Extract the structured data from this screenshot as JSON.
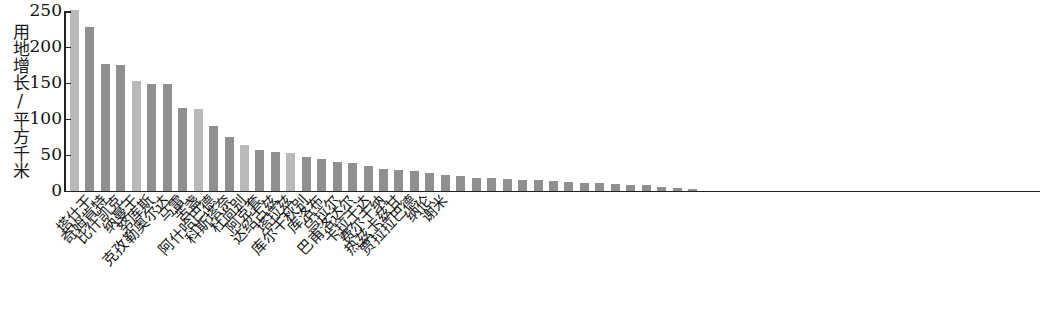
{
  "chart_data": {
    "type": "bar",
    "title": "",
    "subtitle": "",
    "xlabel": "",
    "ylabel": "用地增长/平方千米",
    "ylim": [
      0,
      250
    ],
    "yticks": [
      0,
      50,
      100,
      150,
      200,
      250
    ],
    "grid": false,
    "legend": null,
    "categories": [
      "塔什干",
      "奇姆肯特",
      "比什凯克",
      "纳曼干",
      "努库斯",
      "克孜勒奥尔达",
      "马雷",
      "苦盏",
      "阿什哈巴德",
      "科斯塔奈",
      "杜尚别",
      "阿克套",
      "达绍古兹",
      "塔拉兹",
      "库尔干秋别",
      "库洛布",
      "乌拉尔",
      "巴甫洛达尔",
      "卡拉干达",
      "费尔干纳",
      "热兹卡兹甘",
      "贾拉拉巴德",
      "纳伦",
      "谢米"
    ],
    "values": [
      251,
      228,
      176,
      175,
      153,
      149,
      148,
      115,
      113,
      90,
      74,
      64,
      57,
      54,
      52,
      47,
      44,
      40,
      39,
      34,
      30,
      28,
      27,
      25
    ],
    "bar_colors": [
      "#b9b9b9",
      "#8f8f8f",
      "#8f8f8f",
      "#8f8f8f",
      "#b9b9b9",
      "#8f8f8f",
      "#8f8f8f",
      "#8f8f8f",
      "#b9b9b9",
      "#8f8f8f",
      "#8f8f8f",
      "#b9b9b9",
      "#8f8f8f",
      "#8f8f8f",
      "#b9b9b9",
      "#8f8f8f",
      "#8f8f8f",
      "#8f8f8f",
      "#8f8f8f",
      "#8f8f8f",
      "#8f8f8f",
      "#8f8f8f",
      "#8f8f8f",
      "#8f8f8f"
    ],
    "extra_bars": {
      "note": "unlabeled tail bars continuing the descending distribution to the right edge",
      "values": [
        22,
        20,
        18,
        17,
        16,
        15,
        14,
        13,
        12,
        11,
        10,
        9,
        8,
        7,
        5,
        3,
        2
      ],
      "color": "#8f8f8f"
    },
    "axis_color": "#222222",
    "background": "#ffffff"
  }
}
